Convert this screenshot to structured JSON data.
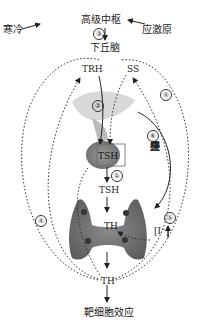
{
  "diagram": {
    "nodes": {
      "cold": "寒冷",
      "higher_center": "高级中枢",
      "stress": "应激原",
      "hypothalamus": "下丘脑",
      "trh": "TRH",
      "ss": "SS",
      "tsh_pituitary": "TSH",
      "tsh": "TSH",
      "th_thyroid": "TH",
      "iodine": "[I⁻]",
      "th": "TH",
      "target": "靶细胞效应"
    },
    "pathway_labels": {
      "p1": "①",
      "p2": "②",
      "p3": "③",
      "p4_top": "④",
      "p4_left": "④",
      "p5": "⑤",
      "p6": "⑥"
    },
    "sympathetic_label": [
      "交",
      "感",
      "神",
      "经"
    ]
  }
}
